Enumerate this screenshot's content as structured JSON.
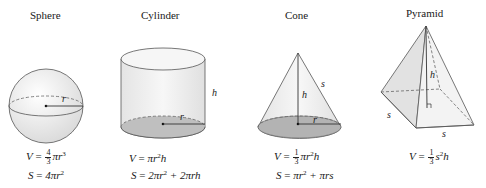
{
  "shapes": [
    {
      "name": "Sphere",
      "labels": [
        "r"
      ],
      "formulas": {
        "volume": {
          "lhs": "V",
          "coef_num": "4",
          "coef_den": "3",
          "rest": "πr",
          "exp": "3"
        },
        "surface": {
          "lhs": "S",
          "text": "4πr",
          "exp": "2"
        }
      }
    },
    {
      "name": "Cylinder",
      "labels": [
        "r",
        "h"
      ],
      "formulas": {
        "volume": {
          "lhs": "V",
          "pre": "πr",
          "exp": "2",
          "post": "h"
        },
        "surface": {
          "lhs": "S",
          "pre": "2πr",
          "exp": "2",
          "post": " + 2πrh"
        }
      }
    },
    {
      "name": "Cone",
      "labels": [
        "h",
        "s",
        "r"
      ],
      "formulas": {
        "volume": {
          "lhs": "V",
          "coef_num": "1",
          "coef_den": "3",
          "pre": "πr",
          "exp": "2",
          "post": "h"
        },
        "surface": {
          "lhs": "S",
          "pre": "πr",
          "exp": "2",
          "post": " + πrs"
        }
      }
    },
    {
      "name": "Pyramid",
      "labels": [
        "h",
        "s",
        "s"
      ],
      "formulas": {
        "volume": {
          "lhs": "V",
          "coef_num": "1",
          "coef_den": "3",
          "pre": "s",
          "exp": "2",
          "post": "h"
        }
      }
    }
  ],
  "colors": {
    "line": "#444444",
    "fill_light": "#ececec",
    "fill_base": "#bdbdbd",
    "dashed": "#666666"
  },
  "eq": " = "
}
